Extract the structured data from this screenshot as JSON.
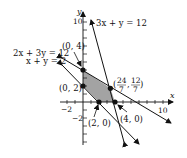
{
  "diagram": {
    "type": "linear-programming-feasible-region",
    "axes": {
      "x_label": "x",
      "y_label": "y",
      "x_ticks": [
        {
          "value": -2,
          "label": "−2"
        },
        {
          "value": 10,
          "label": "10"
        }
      ],
      "y_ticks": [
        {
          "value": 10,
          "label": "10"
        },
        {
          "value": -2,
          "label": "−2"
        }
      ],
      "x_range": [
        -2.5,
        10.5
      ],
      "y_range": [
        -4,
        11
      ]
    },
    "lines": [
      {
        "equation": "3x + y = 12",
        "label": "3x + y = 12"
      },
      {
        "equation": "2x + 3y = 12",
        "label": "2x + 3y = 12"
      },
      {
        "equation": "x + y = 2",
        "label": "x + y = 2"
      }
    ],
    "vertices": [
      {
        "label": "(0, 4)",
        "x": 0,
        "y": 4
      },
      {
        "label": "(0, 2)",
        "x": 0,
        "y": 2
      },
      {
        "label": "(2, 0)",
        "x": 2,
        "y": 0
      },
      {
        "label": "(4, 0)",
        "x": 4,
        "y": 0
      },
      {
        "label": "(24/7, 12/7)",
        "x": 3.4286,
        "y": 1.7143,
        "num1": "24",
        "den1": "7",
        "num2": "12",
        "den2": "7"
      }
    ],
    "region_fill": "#a3a3a3",
    "line_color": "#111111"
  }
}
